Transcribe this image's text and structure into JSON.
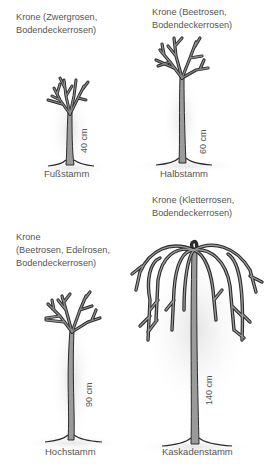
{
  "figure": {
    "trees": [
      {
        "id": "fussstamm",
        "crown_label_line1": "Krone (Zwergrosen,",
        "crown_label_line2": "Bodendeckerrosen)",
        "height_label": "40 cm",
        "name": "Fußstamm"
      },
      {
        "id": "halbstamm",
        "crown_label_line1": "Krone (Beetrosen,",
        "crown_label_line2": "Bodendeckerrosen)",
        "height_label": "60 cm",
        "name": "Halbstamm"
      },
      {
        "id": "hochstamm",
        "crown_label_line1": "Krone",
        "crown_label_line2": "(Beetrosen, Edelrosen,",
        "crown_label_line3": "Bodendeckerrosen)",
        "height_label": "90 cm",
        "name": "Hochstamm"
      },
      {
        "id": "kaskadenstamm",
        "crown_label_line1": "Krone (Kletterrosen,",
        "crown_label_line2": "Bodendeckerrosen)",
        "height_label": "140 cm",
        "name": "Kaskadenstamm"
      }
    ]
  },
  "colors": {
    "ink": "#2a2a2a",
    "fill": "#9a9a9a",
    "shadow": "#e6e6e6",
    "text": "#555555"
  }
}
